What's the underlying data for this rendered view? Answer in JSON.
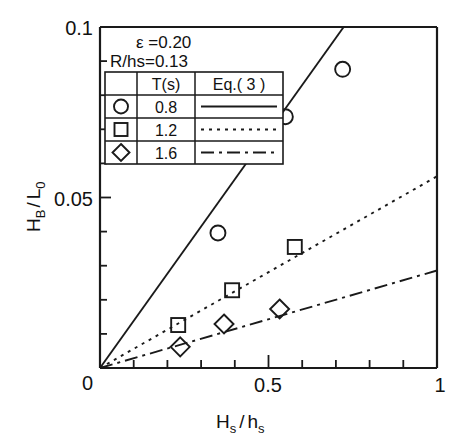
{
  "chart_data": {
    "type": "scatter",
    "title": "",
    "xlabel": "Hs / hs",
    "ylabel": "HB / L0",
    "xlim": [
      0,
      1
    ],
    "ylim": [
      0,
      0.1
    ],
    "grid": false,
    "x_ticklabels": [
      "0",
      "0.5",
      "1"
    ],
    "x_tickvalues": [
      0,
      0.5,
      1
    ],
    "x_minor_step": 0.1,
    "y_ticklabels": [
      "0",
      "0.05",
      "0.1"
    ],
    "y_tickvalues": [
      0,
      0.05,
      0.1
    ],
    "y_minor_step": 0.01,
    "legend_position": "upper-left-inside",
    "annotations": [
      {
        "name": "epsilon",
        "symbol": "ε",
        "relation": "=0.20",
        "text": "ε  =0.20"
      },
      {
        "name": "R-over-hs",
        "text": "R/hs=0.13"
      }
    ],
    "series": [
      {
        "name": "T = 0.8 s",
        "marker": "circle",
        "line_style": "solid",
        "T_label": "0.8",
        "points": [
          {
            "x": 0.35,
            "y": 0.0396
          },
          {
            "x": 0.55,
            "y": 0.0737
          },
          {
            "x": 0.72,
            "y": 0.0876
          }
        ],
        "fit_slope": 0.137,
        "fit_x_end": 0.723,
        "fit_y_end": 0.1
      },
      {
        "name": "T = 1.2 s",
        "marker": "square",
        "line_style": "dotted",
        "T_label": "1.2",
        "points": [
          {
            "x": 0.232,
            "y": 0.0126
          },
          {
            "x": 0.392,
            "y": 0.0228
          },
          {
            "x": 0.578,
            "y": 0.0355
          }
        ],
        "fit_slope": 0.0562,
        "fit_x_end": 1.0,
        "fit_y_end": 0.0562
      },
      {
        "name": "T = 1.6 s",
        "marker": "diamond",
        "line_style": "dashdot",
        "T_label": "1.6",
        "points": [
          {
            "x": 0.238,
            "y": 0.0062
          },
          {
            "x": 0.368,
            "y": 0.0129
          },
          {
            "x": 0.533,
            "y": 0.0173
          }
        ],
        "fit_slope": 0.0286,
        "fit_x_end": 1.0,
        "fit_y_end": 0.0286
      }
    ]
  },
  "legend_table": {
    "headers": [
      "",
      "T(s)",
      "Eq.( 3 )"
    ],
    "rows": [
      {
        "marker": "circle",
        "T": "0.8",
        "line": "solid"
      },
      {
        "marker": "square",
        "T": "1.2",
        "line": "dotted"
      },
      {
        "marker": "diamond",
        "T": "1.6",
        "line": "dashdot"
      }
    ]
  },
  "axis": {
    "x_title_main": "H",
    "x_title_sub1": "s",
    "x_title_slash": "/",
    "x_title_main2": "h",
    "x_title_sub2": "s",
    "y_title_main": "H",
    "y_title_sub1": "B",
    "y_title_slash": "/",
    "y_title_main2": "L",
    "y_title_sub2": "0",
    "x_tick_0": "0",
    "x_tick_half": "0.5",
    "x_tick_1": "1",
    "y_tick_0": "0",
    "y_tick_half": "0.05",
    "y_tick_1": "0.1"
  },
  "colors": {
    "ink": "#1a1a1a",
    "background": "#ffffff"
  }
}
